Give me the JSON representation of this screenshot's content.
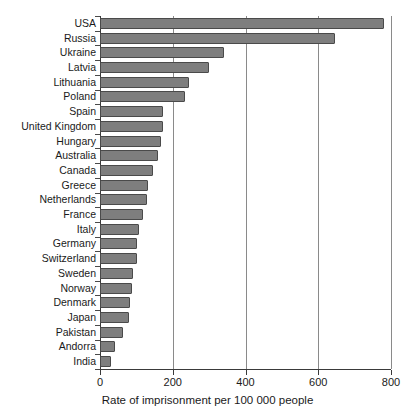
{
  "header_faint": " ",
  "chart_data": {
    "type": "bar",
    "orientation": "horizontal",
    "title": "",
    "xlabel": "Rate of imprisonment per 100 000 people",
    "ylabel": "",
    "xlim": [
      0,
      800
    ],
    "xticks": [
      0,
      200,
      400,
      600,
      800
    ],
    "grid": "vertical",
    "legend": "none",
    "bar_color": "#7e7e7e",
    "bar_edge_color": "#4a4a4a",
    "categories": [
      "USA",
      "Russia",
      "Ukraine",
      "Latvia",
      "Lithuania",
      "Poland",
      "Spain",
      "United Kingdom",
      "Hungary",
      "Australia",
      "Canada",
      "Greece",
      "Netherlands",
      "France",
      "Italy",
      "Germany",
      "Switzerland",
      "Sweden",
      "Norway",
      "Denmark",
      "Japan",
      "Pakistan",
      "Andorra",
      "India"
    ],
    "values": [
      781,
      645,
      340,
      300,
      245,
      235,
      172,
      172,
      167,
      160,
      145,
      133,
      128,
      117,
      106,
      103,
      103,
      92,
      88,
      82,
      80,
      62,
      42,
      29
    ]
  }
}
